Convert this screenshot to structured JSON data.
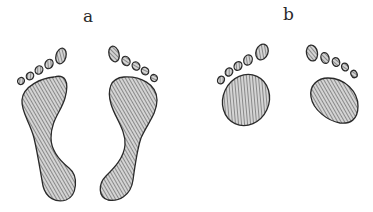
{
  "figure": {
    "panels": [
      {
        "id": "a",
        "label": "a",
        "description": "Footprints with normal arch (full sole outline, toe to heel)"
      },
      {
        "id": "b",
        "label": "b",
        "description": "Footprints showing only forefoot balls and toes"
      }
    ],
    "colors": {
      "ink": "#2a2a2a",
      "hatch": "#555555",
      "fill": "#cfcfcf",
      "background": "#ffffff"
    }
  }
}
